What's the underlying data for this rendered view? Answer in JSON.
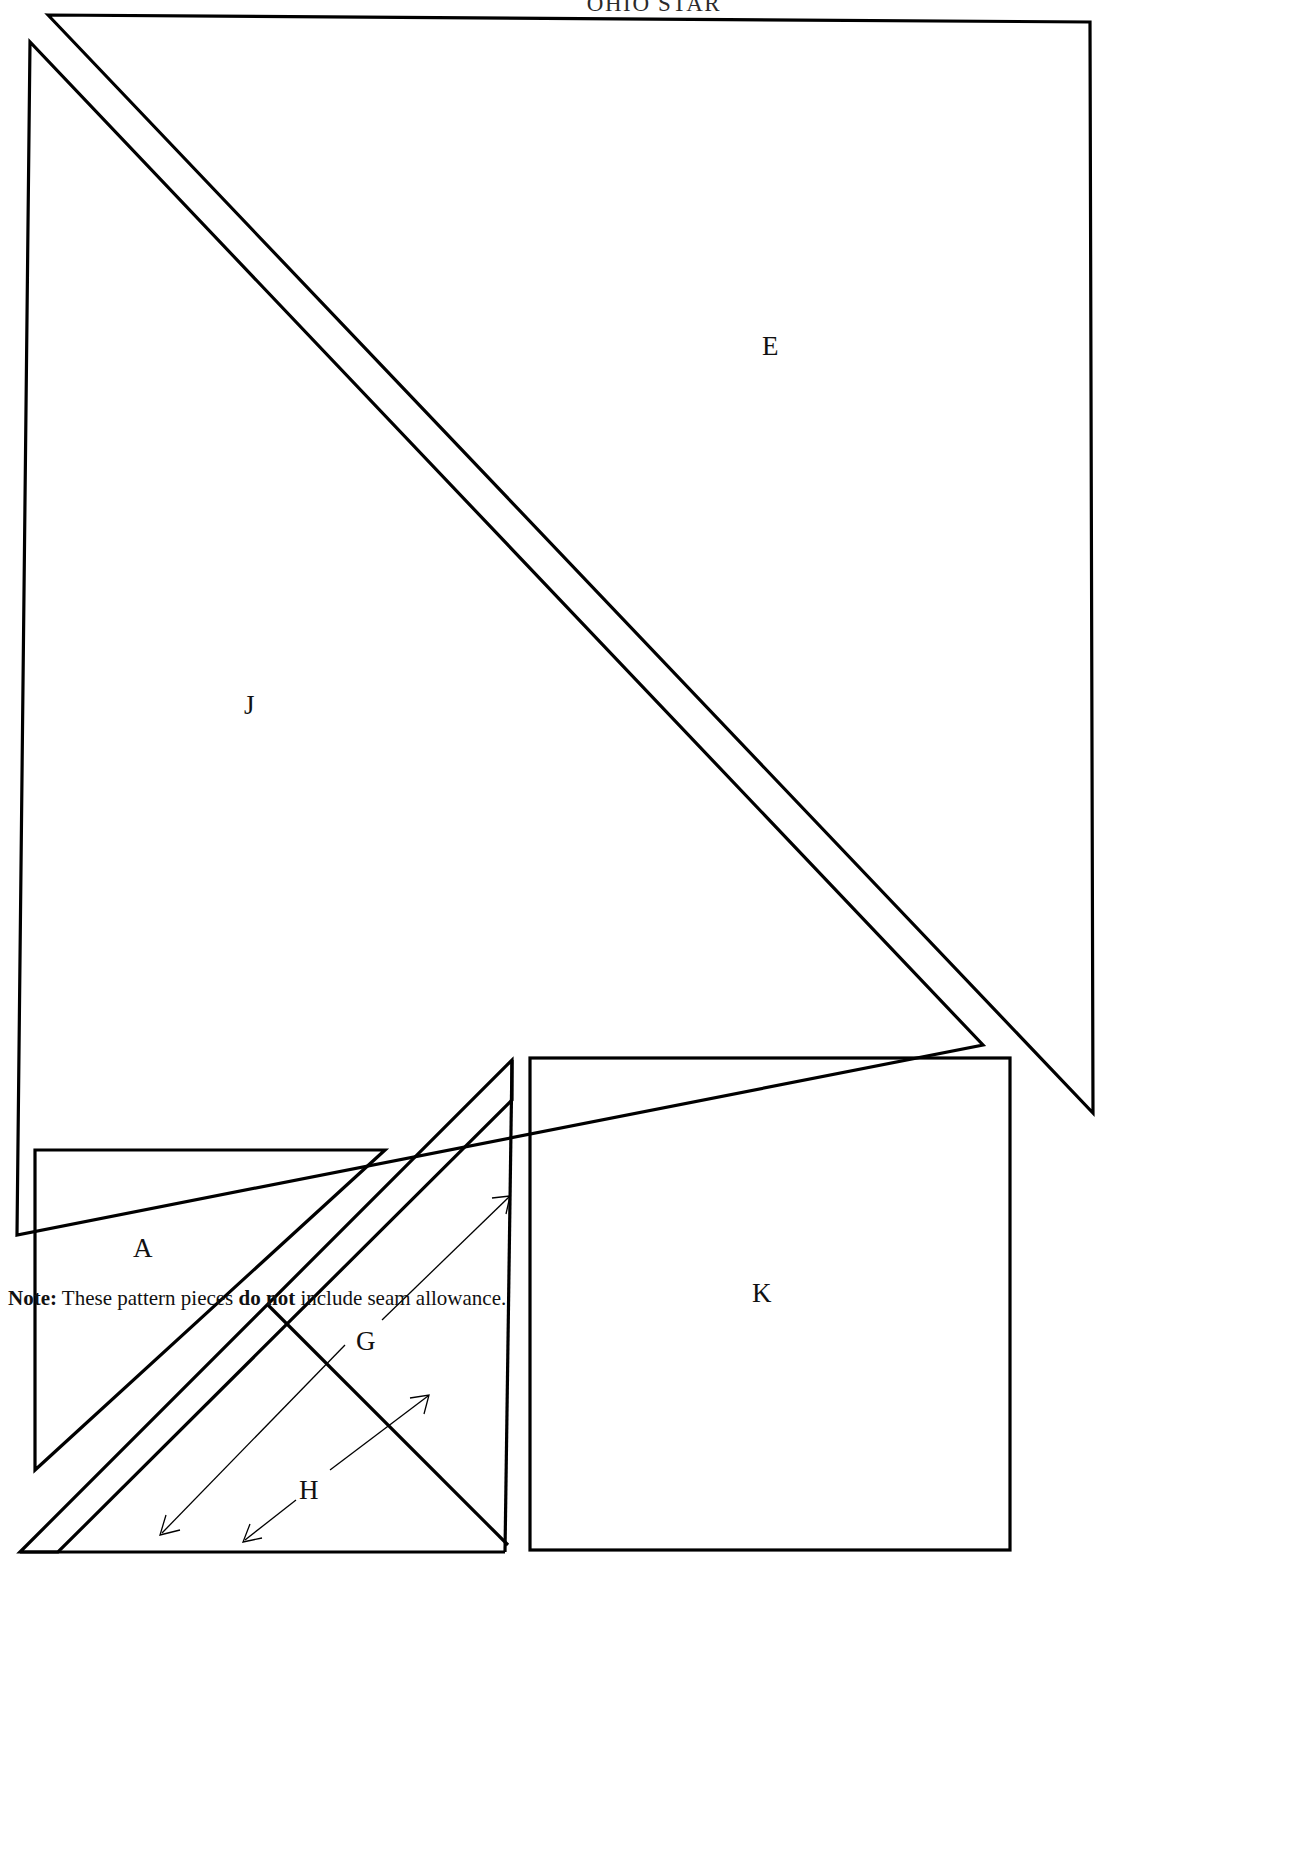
{
  "document": {
    "title": "OHIO STAR",
    "kind": "quilt-pattern-template-sheet",
    "page_background": "#ffffff",
    "ink_color": "#000000",
    "width_px": 1308,
    "height_px": 1858
  },
  "note": {
    "prefix_bold": "Note:",
    "text_part_1": " These pattern pieces ",
    "emphasis": "do not",
    "text_part_2": " include seam allowance."
  },
  "pieces": [
    {
      "id": "E",
      "label": "E",
      "shape": "right-triangle",
      "label_x": 762,
      "label_y": 333,
      "description": "large right triangle, right angle at top-right"
    },
    {
      "id": "J",
      "label": "J",
      "shape": "right-triangle",
      "label_x": 244,
      "label_y": 692,
      "description": "large right triangle, right angle at bottom-left"
    },
    {
      "id": "A",
      "label": "A",
      "shape": "right-triangle",
      "label_x": 133,
      "label_y": 1235,
      "description": "medium right triangle, right angle at top-left"
    },
    {
      "id": "G",
      "label": "G",
      "shape": "narrow-diagonal-strip",
      "label_x": 356,
      "label_y": 1328,
      "description": "long narrow diagonal strip piece"
    },
    {
      "id": "H",
      "label": "H",
      "shape": "small-triangle",
      "label_x": 299,
      "label_y": 1477,
      "description": "small triangle at lower area of diagonal strip assembly"
    },
    {
      "id": "K",
      "label": "K",
      "shape": "square",
      "label_x": 752,
      "label_y": 1280,
      "description": "square patch piece"
    }
  ],
  "geometry": {
    "triangle_E": "48,15 1090,22 1093,1113",
    "triangle_J": "30,42 17,1235 983,1045",
    "triangle_A": "35,1150 385,1150 35,1470",
    "square_K": {
      "x": 530,
      "y": 1058,
      "width": 480,
      "height": 492
    },
    "strip_G_outer": "512,1060 512,1112 70,1550 70,1550",
    "strip_G_inner": "268,1305 497,1534",
    "baseline_bottom": "28,1552 500,1552"
  },
  "annotations": [
    {
      "name": "g-leader",
      "from_label": "G",
      "direction": "up-right",
      "has_arrowhead": true
    },
    {
      "name": "g-dimension",
      "from_label": "G",
      "direction": "down-left",
      "has_arrowhead": true
    },
    {
      "name": "h-leader-up",
      "from_label": "H",
      "direction": "up-right",
      "has_arrowhead": true
    },
    {
      "name": "h-leader-down",
      "from_label": "H",
      "direction": "down-left",
      "has_arrowhead": true
    }
  ]
}
